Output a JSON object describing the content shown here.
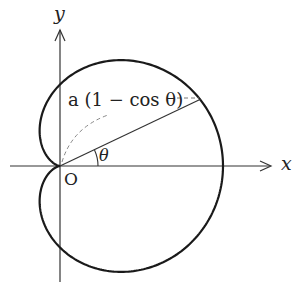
{
  "diagram": {
    "axes": {
      "x_label": "x",
      "y_label": "y",
      "origin_label": "O"
    },
    "curve_label": "a (1 − cos θ)",
    "angle_label": "θ",
    "curve": {
      "type": "cardioid",
      "equation": "r = a(1 − cos θ)"
    },
    "colors": {
      "stroke": "#1a1a1a",
      "dashed": "#777777",
      "background": "#ffffff"
    }
  }
}
